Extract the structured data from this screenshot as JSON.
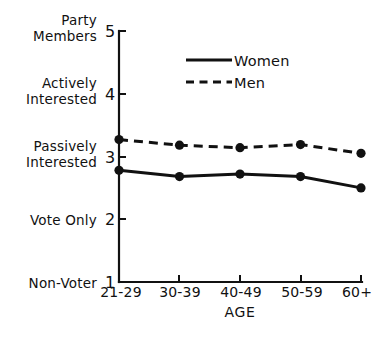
{
  "chart_data": {
    "type": "line",
    "title": "",
    "xlabel": "AGE",
    "ylabel": "",
    "categories": [
      "21-29",
      "30-39",
      "40-49",
      "50-59",
      "60+"
    ],
    "ylim": [
      1,
      5
    ],
    "xlim": [
      0,
      4
    ],
    "grid": false,
    "legend_position": "top-center",
    "y_tick_values": [
      1,
      2,
      3,
      4,
      5
    ],
    "y_tick_labels": [
      "1",
      "2",
      "3",
      "4",
      "5"
    ],
    "y_category_labels": [
      {
        "value": 5,
        "label_line1": "Party",
        "label_line2": "Members"
      },
      {
        "value": 4,
        "label_line1": "Actively",
        "label_line2": "Interested"
      },
      {
        "value": 3,
        "label_line1": "Passively",
        "label_line2": "Interested"
      },
      {
        "value": 2,
        "label_line1": "Vote Only",
        "label_line2": ""
      },
      {
        "value": 1,
        "label_line1": "Non-Voter",
        "label_line2": ""
      }
    ],
    "series": [
      {
        "name": "Women",
        "style": "solid",
        "marker": "filled-circle",
        "values": [
          2.78,
          2.68,
          2.72,
          2.68,
          2.5
        ]
      },
      {
        "name": "Men",
        "style": "dashed",
        "marker": "filled-circle",
        "values": [
          3.27,
          3.18,
          3.14,
          3.19,
          3.05
        ]
      }
    ],
    "colors": {
      "ink": "#111111",
      "background": "#ffffff"
    }
  },
  "legend": {
    "items": [
      {
        "label": "Women",
        "style": "solid"
      },
      {
        "label": "Men",
        "style": "dashed"
      }
    ]
  },
  "axes": {
    "x_title": "AGE"
  }
}
